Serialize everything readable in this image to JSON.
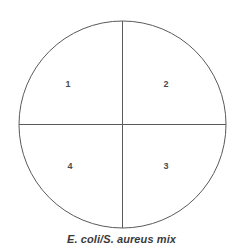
{
  "diagram": {
    "name": "petri-dish-quadrant-streak",
    "caption": "E. coli/S. aureus mix",
    "plate": {
      "center_x": 122.5,
      "center_y": 124.5,
      "radius": 103.5,
      "outline_color": "#5a5a5a",
      "fill_color": "#ffffff",
      "stroke_width": 1
    },
    "dividers": {
      "vertical_label": "vertical divider",
      "horizontal_label": "horizontal divider",
      "color": "#5a5a5a"
    },
    "quadrants": [
      {
        "id": "q1",
        "label": "1",
        "position": "top-left"
      },
      {
        "id": "q2",
        "label": "2",
        "position": "top-right"
      },
      {
        "id": "q3",
        "label": "3",
        "position": "bottom-right"
      },
      {
        "id": "q4",
        "label": "4",
        "position": "bottom-left"
      }
    ],
    "background_color": "#ffffff",
    "label_color": "#4b4b4b",
    "caption_color": "#3a3a3a"
  }
}
